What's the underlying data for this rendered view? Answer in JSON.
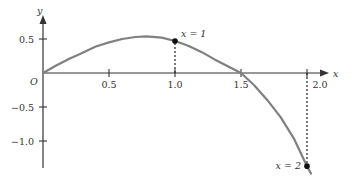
{
  "chart_data": {
    "type": "line",
    "title": "",
    "xlabel": "x",
    "ylabel": "y",
    "origin_label": "O",
    "xlim": [
      0,
      2.15
    ],
    "ylim": [
      -1.45,
      0.75
    ],
    "grid": false,
    "x_ticks": [
      0.5,
      1.0,
      1.5,
      2.0
    ],
    "x_tick_labels": [
      "0.5",
      "1.0",
      "1.5",
      "2.0"
    ],
    "y_ticks": [
      0.5,
      -0.5,
      -1.0
    ],
    "y_tick_labels": [
      "0.5",
      "−0.5",
      "−1.0"
    ],
    "series": [
      {
        "name": "curve",
        "color": "#808080",
        "x": [
          0,
          0.1,
          0.2,
          0.28,
          0.4,
          0.5,
          0.6,
          0.7,
          0.78,
          0.9,
          1.0,
          1.1,
          1.2,
          1.3,
          1.4,
          1.5,
          1.6,
          1.7,
          1.8,
          1.9,
          2.0,
          2.03
        ],
        "y": [
          0,
          0.11,
          0.21,
          0.28,
          0.39,
          0.45,
          0.5,
          0.53,
          0.54,
          0.52,
          0.47,
          0.4,
          0.31,
          0.2,
          0.1,
          0,
          -0.18,
          -0.4,
          -0.65,
          -0.96,
          -1.37,
          -1.48
        ]
      }
    ],
    "highlighted_points": [
      {
        "x": 1.0,
        "y": 0.47,
        "label": "x = 1"
      },
      {
        "x": 2.0,
        "y": -1.37,
        "label": "x = 2"
      }
    ]
  }
}
